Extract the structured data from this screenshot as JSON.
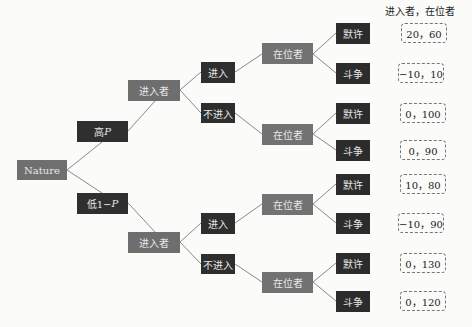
{
  "header": {
    "payoff_label": "进入者，在位者"
  },
  "root": {
    "label": "Nature"
  },
  "chance": {
    "high": {
      "label": "高",
      "prob": "P"
    },
    "low": {
      "label": "低1−",
      "prob": "P"
    }
  },
  "branches": [
    {
      "entrant": "进入者",
      "enter": "进入",
      "not_enter": "不进入",
      "enter_incumbent": "在位者",
      "not_enter_incumbent": "在位者",
      "leaves": [
        "默许",
        "斗争",
        "默许",
        "斗争"
      ],
      "payoffs": [
        "20，60",
        "−10，10",
        "0，100",
        "0，90"
      ]
    },
    {
      "entrant": "进入者",
      "enter": "进入",
      "not_enter": "不进入",
      "enter_incumbent": "在位者",
      "not_enter_incumbent": "在位者",
      "leaves": [
        "默许",
        "斗争",
        "默许",
        "斗争"
      ],
      "payoffs": [
        "10，80",
        "−10，90",
        "0，130",
        "0，120"
      ]
    }
  ],
  "colors": {
    "edge": "#8a8a8a",
    "dark_node": "#2e2e2e",
    "mid_node": "#6f6f6f"
  }
}
